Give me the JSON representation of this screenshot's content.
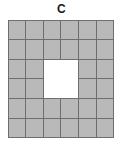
{
  "figure": {
    "label": "C",
    "background_color": "#ffffff"
  },
  "chart_data": {
    "type": "heatmap",
    "title": "C",
    "xlabel": "",
    "ylabel": "",
    "grid_rows": 6,
    "grid_cols": 6,
    "total_cells": 36,
    "filled_cells": 32,
    "empty_cells": 4,
    "hole": {
      "rows": [
        3,
        4
      ],
      "cols": [
        3,
        4
      ],
      "width_cells": 2,
      "height_cells": 2
    },
    "legend": [
      {
        "name": "filled tile",
        "color": "#b9b9b9"
      },
      {
        "name": "hole",
        "color": "#ffffff"
      }
    ],
    "tile_border_color": "#6e6e6e",
    "cells": [
      [
        1,
        1,
        1,
        1,
        1,
        1
      ],
      [
        1,
        1,
        1,
        1,
        1,
        1
      ],
      [
        1,
        1,
        0,
        0,
        1,
        1
      ],
      [
        1,
        1,
        0,
        0,
        1,
        1
      ],
      [
        1,
        1,
        1,
        1,
        1,
        1
      ],
      [
        1,
        1,
        1,
        1,
        1,
        1
      ]
    ]
  }
}
